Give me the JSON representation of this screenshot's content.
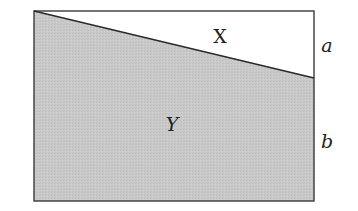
{
  "diagram": {
    "type": "rectangle-split-by-diagonal",
    "colors": {
      "fill": "#c9c9c9",
      "stroke": "#3a3a3a",
      "background": "#ffffff"
    },
    "regions": {
      "upper": {
        "label": "X"
      },
      "lower": {
        "label": "Y"
      }
    },
    "side_labels": {
      "upper_segment": "a",
      "lower_segment": "b"
    }
  }
}
